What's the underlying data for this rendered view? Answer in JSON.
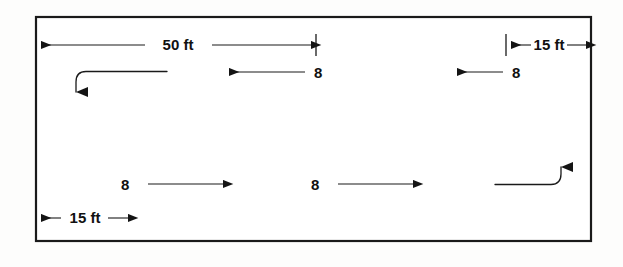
{
  "figure": {
    "type": "engineering-dimension-diagram",
    "title": "",
    "background_color": "#fdfdfc",
    "line_color": "#1a1a1a",
    "frame": {
      "name": "roadway-boundary-rectangle",
      "x": 35,
      "y": 16,
      "width": 557,
      "height": 226
    },
    "dimensions": [
      {
        "id": "dim-50ft",
        "label": "50 ft",
        "value": 50,
        "unit": "ft",
        "orientation": "horizontal",
        "style": "single-arrow-right",
        "x_start": 36,
        "x_end": 316,
        "y": 45,
        "text_x": 178,
        "text_y": 50
      },
      {
        "id": "dim-15ft-right",
        "label": "15 ft",
        "value": 15,
        "unit": "ft",
        "orientation": "horizontal",
        "style": "double-arrow-outward",
        "x_start": 506,
        "x_end": 591,
        "y": 45,
        "text_x": 548,
        "text_y": 50
      },
      {
        "id": "dim-15ft-left",
        "label": "15 ft",
        "value": 15,
        "unit": "ft",
        "orientation": "horizontal",
        "style": "double-arrow-outward",
        "x_start": 36,
        "x_end": 133,
        "y": 218,
        "text_x": 84,
        "text_y": 223
      }
    ],
    "flow_arrows": [
      {
        "id": "flow-upper-left",
        "label": "8",
        "value": 8,
        "direction": "left",
        "x_tail": 305,
        "x_head": 224,
        "y": 72,
        "text_x": 313,
        "text_y": 78
      },
      {
        "id": "flow-upper-right",
        "label": "8",
        "value": 8,
        "direction": "left",
        "x_tail": 503,
        "x_head": 452,
        "y": 72,
        "text_x": 511,
        "text_y": 78
      },
      {
        "id": "flow-lower-left",
        "label": "8",
        "value": 8,
        "direction": "right",
        "x_tail": 148,
        "x_head": 228,
        "y": 184,
        "text_x": 126,
        "text_y": 190
      },
      {
        "id": "flow-lower-right",
        "label": "8",
        "value": 8,
        "direction": "right",
        "x_tail": 338,
        "x_head": 418,
        "y": 184,
        "text_x": 316,
        "text_y": 190
      }
    ],
    "turn_arrows": [
      {
        "id": "turn-upper-left-down",
        "description": "left-turn curving downward",
        "enters_from": "right",
        "exits_toward": "down",
        "x_start": 167,
        "y_line": 72,
        "x_corner": 76,
        "y_head": 104
      },
      {
        "id": "turn-lower-right-up",
        "description": "right-turn curving upward",
        "enters_from": "left",
        "exits_toward": "up",
        "x_start": 495,
        "y_line": 184,
        "x_corner": 561,
        "y_head": 154
      }
    ],
    "tick_marks": [
      {
        "id": "tick-50ft-end",
        "x": 316,
        "y_top": 34,
        "y_bottom": 56
      },
      {
        "id": "tick-15ft-right-start",
        "x": 506,
        "y_top": 34,
        "y_bottom": 56
      }
    ]
  }
}
